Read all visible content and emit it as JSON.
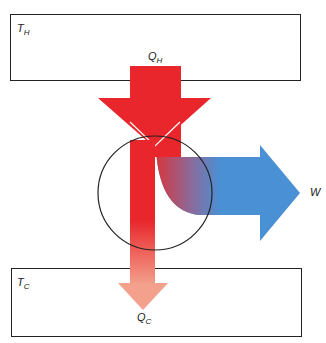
{
  "hot_reservoir": {
    "symbol": "T",
    "subscript": "H"
  },
  "cold_reservoir": {
    "symbol": "T",
    "subscript": "C"
  },
  "heat_in": {
    "symbol": "Q",
    "subscript": "H"
  },
  "heat_out": {
    "symbol": "Q",
    "subscript": "C"
  },
  "work_out": {
    "symbol": "W"
  },
  "colors": {
    "heat_in": "#e8262b",
    "heat_out": "#f3a08c",
    "work": "#4a90d4",
    "outline": "#222222"
  }
}
